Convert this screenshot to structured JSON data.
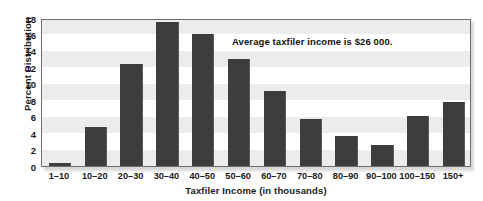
{
  "figure": {
    "top_remnant_text": "",
    "background_color": "#ffffff"
  },
  "chart_data": {
    "type": "bar",
    "title": "",
    "xlabel": "Taxfiler Income (in thousands)",
    "ylabel": "Percent Distribution",
    "categories": [
      "1–10",
      "10–20",
      "20–30",
      "30–40",
      "40–50",
      "50–60",
      "60–70",
      "70–80",
      "80–90",
      "90–100",
      "100–150",
      "150+"
    ],
    "values": [
      0.4,
      4.7,
      12.4,
      17.5,
      16.1,
      13.0,
      9.1,
      5.7,
      3.7,
      2.6,
      6.1,
      7.8
    ],
    "ylim": [
      0,
      18
    ],
    "yticks": [
      0,
      2,
      4,
      6,
      8,
      10,
      12,
      14,
      16,
      18
    ],
    "ytick_labels": [
      "0",
      "2",
      "4",
      "6",
      "8",
      "10",
      "12",
      "14",
      "16",
      "18"
    ],
    "grid": "alternating-horizontal-bands",
    "legend": "none",
    "bar_color": "#3d3d3d",
    "band_color": "#ececec",
    "frame_color": "#6e6e6e",
    "annotations": [
      {
        "text": "Average taxfiler income is $26 000.",
        "name": "average-income-annotation"
      }
    ]
  }
}
